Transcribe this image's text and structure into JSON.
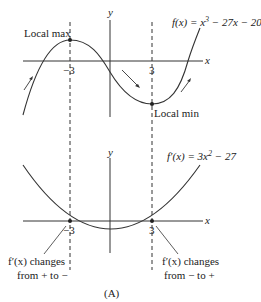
{
  "figure": {
    "caption": "(A)",
    "top_graph": {
      "function_label": "f(x) = x³ − 27x − 20",
      "function_label_parts": {
        "pre": "f(x) = x",
        "sup": "3",
        "post": " − 27x − 20"
      },
      "x_axis_label": "x",
      "y_axis_label": "y",
      "tick_neg": "−3",
      "tick_pos": "3",
      "local_max_label": "Local max",
      "local_min_label": "Local min"
    },
    "bottom_graph": {
      "function_label": "f′(x) = 3x² − 27",
      "function_label_parts": {
        "pre": "f′(x) = 3x",
        "sup": "2",
        "post": " − 27"
      },
      "x_axis_label": "x",
      "y_axis_label": "y",
      "tick_neg": "−3",
      "tick_pos": "3",
      "left_note_line1": "f′(x) changes",
      "left_note_line2": "from + to −",
      "right_note_line1": "f′(x) changes",
      "right_note_line2": "from − to +"
    },
    "colors": {
      "line": "#333333",
      "text": "#222222"
    }
  }
}
